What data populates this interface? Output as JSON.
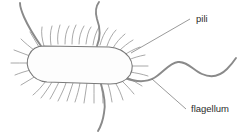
{
  "diagram": {
    "background_color": "#ffffff",
    "labels": [
      {
        "id": "pili",
        "text": "pili",
        "text_x": 196,
        "text_y": 22,
        "leader_from_x": 190,
        "leader_from_y": 19,
        "leader_to_x": 131,
        "leader_to_y": 53,
        "target": "pili-cluster-right-end"
      },
      {
        "id": "flagellum",
        "text": "flagellum",
        "text_x": 191,
        "text_y": 112,
        "leader_from_x": 186,
        "leader_from_y": 109,
        "leader_to_x": 152,
        "leader_to_y": 79,
        "target": "flagellum-main-right"
      }
    ],
    "colors": {
      "cell_outline": "#7a7a7a",
      "cell_fill": "#fdfdfd",
      "pilus_stroke": "#8c8c8c",
      "flagellum_stroke": "#8a8a8a",
      "leader_stroke": "#6e6e6e",
      "label_text": "#2b2b2b"
    },
    "cell_body": {
      "shape": "rounded-capsule",
      "path": "M 44 46 Q 33 46 29 55 Q 25 64 30 72 Q 35 81 47 82 L 110 84 Q 124 84 130 75 Q 135 66 129 57 Q 122 48 109 47 Z"
    },
    "pili": [
      "M 44 46 C 42 39 41 33 42 27",
      "M 51 45 C 50 38 50 32 52 26",
      "M 58 44 C 57 37 58 31 60 25",
      "M 65 44 C 65 37 66 31 69 26",
      "M 72 44 C 72 37 73 31 76 25",
      "M 79 44 C 79 37 81 31 84 26",
      "M 86 44 C 87 37 88 31 91 27",
      "M 93 45 C 94 38 96 32 99 27",
      "M 100 45 C 102 38 104 33 108 28",
      "M 107 46 C 109 40 112 34 116 30",
      "M 113 48 C 116 43 120 38 125 34",
      "M 119 51 C 123 47 128 43 133 40",
      "M 124 55 C 129 52 134 49 140 47",
      "M 128 60 C 133 58 139 56 145 55",
      "M 130 66 C 136 66 142 66 148 66",
      "M 130 72 C 136 73 142 74 148 76",
      "M 127 77 C 132 80 137 83 142 86",
      "M 122 81 C 126 85 130 89 134 94",
      "M 116 84 C 119 89 121 94 123 100",
      "M 108 84 C 110 90 111 96 112 102",
      "M 101 84 C 102 90 103 96 103 103",
      "M 94 84 C 94 90 94 97 94 103",
      "M 87 83 C 86 90 85 96 84 103",
      "M 80 83 C 79 89 77 96 75 102",
      "M 73 83 C 71 89 69 95 67 101",
      "M 66 83 C 64 89 61 95 58 101",
      "M 59 82 C 56 88 53 94 50 99",
      "M 52 82 C 49 87 45 93 41 98",
      "M 46 81 C 42 86 38 91 33 95",
      "M 36 76 C 31 79 26 82 21 85",
      "M 31 70 C 26 71 20 73 15 75",
      "M 28 63 C 22 63 17 63 11 63",
      "M 30 56 C 25 54 19 52 14 50",
      "M 34 50 C 30 47 25 43 21 39",
      "M 39 47 C 36 42 33 37 30 32"
    ],
    "flagella": [
      {
        "id": "flagellum-upper-left",
        "path": "M 41 46 C 34 36 28 26 24 17 C 21 10 20 6 20 3"
      },
      {
        "id": "flagellum-upper-middle",
        "path": "M 97 46 C 101 36 100 27 97 19 C 95 12 96 6 99 2"
      },
      {
        "id": "flagellum-lower",
        "path": "M 101 84 C 104 94 106 104 104 113 C 103 120 101 126 98 131"
      },
      {
        "id": "flagellum-main-right",
        "path": "M 125 78 C 136 82 145 83 154 78 C 163 73 169 63 178 62 C 187 61 193 70 202 74 C 211 78 220 76 227 69 C 231 65 234 61 236 58"
      }
    ]
  }
}
